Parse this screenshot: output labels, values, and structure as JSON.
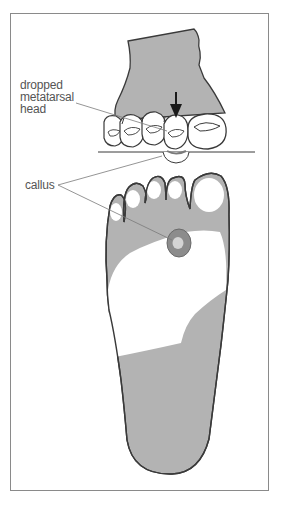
{
  "figure": {
    "type": "medical-illustration",
    "colors": {
      "skin_shade": "#b3b3b3",
      "outline": "#3a3a3a",
      "callus_ring": "#8c8c8c",
      "callus_center": "#d4d4d4",
      "leader_line": "#7a7a7a",
      "frame": "#8a8a8a"
    }
  },
  "labels": {
    "dropped_metatarsal_head": [
      "dropped",
      "metatarsal",
      "head"
    ],
    "callus": "callus"
  },
  "icons": {
    "pressure_arrow": "down-arrow"
  }
}
